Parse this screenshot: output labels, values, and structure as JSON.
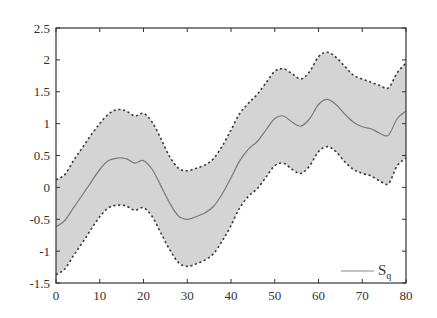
{
  "chart_data": {
    "type": "area",
    "title": "",
    "xlabel": "",
    "ylabel": "",
    "xlim": [
      0,
      80
    ],
    "ylim": [
      -1.5,
      2.5
    ],
    "grid": false,
    "legend_position": "lower right",
    "x_ticks": [
      0,
      10,
      20,
      30,
      40,
      50,
      60,
      70,
      80
    ],
    "y_ticks": [
      -1.5,
      -1,
      -0.5,
      0,
      0.5,
      1,
      1.5,
      2,
      2.5
    ],
    "x_tick_labels": [
      "0",
      "10",
      "20",
      "30",
      "40",
      "50",
      "60",
      "70",
      "80"
    ],
    "y_tick_labels": [
      "-1.5",
      "-1",
      "-0.5",
      "0",
      "0.5",
      "1",
      "1.5",
      "2",
      "2.5"
    ],
    "x": [
      0,
      2,
      4,
      6,
      8,
      10,
      12,
      14,
      16,
      18,
      20,
      22,
      24,
      26,
      28,
      30,
      32,
      34,
      36,
      38,
      40,
      42,
      44,
      46,
      48,
      50,
      52,
      54,
      56,
      58,
      60,
      62,
      64,
      66,
      68,
      70,
      72,
      74,
      76,
      78,
      80
    ],
    "series": [
      {
        "name": "S_q",
        "role": "mean",
        "style": "solid",
        "color": "#777777",
        "values": [
          -0.62,
          -0.52,
          -0.32,
          -0.12,
          0.08,
          0.28,
          0.42,
          0.46,
          0.45,
          0.38,
          0.42,
          0.28,
          0.02,
          -0.25,
          -0.45,
          -0.5,
          -0.46,
          -0.4,
          -0.3,
          -0.1,
          0.15,
          0.42,
          0.6,
          0.72,
          0.9,
          1.08,
          1.12,
          1.02,
          0.96,
          1.08,
          1.3,
          1.38,
          1.3,
          1.15,
          1.02,
          0.95,
          0.92,
          0.85,
          0.82,
          1.08,
          1.2
        ]
      },
      {
        "name": "upper bound",
        "role": "upper",
        "style": "dashed",
        "color": "#444444",
        "values": [
          0.12,
          0.2,
          0.42,
          0.62,
          0.82,
          1.0,
          1.15,
          1.22,
          1.2,
          1.12,
          1.16,
          1.02,
          0.76,
          0.48,
          0.3,
          0.26,
          0.3,
          0.35,
          0.45,
          0.65,
          0.9,
          1.16,
          1.32,
          1.46,
          1.64,
          1.82,
          1.86,
          1.78,
          1.7,
          1.82,
          2.05,
          2.12,
          2.04,
          1.9,
          1.76,
          1.7,
          1.65,
          1.6,
          1.56,
          1.8,
          1.95
        ]
      },
      {
        "name": "lower bound",
        "role": "lower",
        "style": "dashed",
        "color": "#444444",
        "values": [
          -1.37,
          -1.28,
          -1.07,
          -0.87,
          -0.66,
          -0.46,
          -0.32,
          -0.28,
          -0.29,
          -0.36,
          -0.32,
          -0.46,
          -0.72,
          -0.98,
          -1.18,
          -1.24,
          -1.2,
          -1.14,
          -1.04,
          -0.84,
          -0.6,
          -0.32,
          -0.14,
          -0.02,
          0.16,
          0.34,
          0.38,
          0.28,
          0.22,
          0.34,
          0.56,
          0.64,
          0.56,
          0.4,
          0.28,
          0.22,
          0.18,
          0.1,
          0.06,
          0.34,
          0.46
        ]
      }
    ],
    "band_fill_color": "#d4d4d4",
    "legend": [
      {
        "label": "S",
        "subscript": "q",
        "style": "solid"
      }
    ]
  },
  "legend": {
    "main": "S",
    "sub": "q"
  }
}
